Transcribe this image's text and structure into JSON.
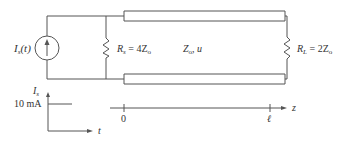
{
  "circuit": {
    "source_label": {
      "main": "I",
      "sub": "s",
      "arg": "(t)"
    },
    "rs_label": {
      "main": "R",
      "sub": "s",
      "eq": " = 4Z",
      "sub2": "o"
    },
    "line_label": {
      "main": "Z",
      "sub": "o",
      "rest": ", u"
    },
    "rl_label": {
      "main": "R",
      "sub": "L",
      "eq": " = 2Z",
      "sub2": "o"
    }
  },
  "source_waveform": {
    "ylabel": {
      "main": "I",
      "sub": "s"
    },
    "level_label": "10 mA",
    "xlabel": "t"
  },
  "z_axis": {
    "label": "z",
    "ticks": [
      "0",
      "ℓ"
    ]
  },
  "colors": {
    "line": "#555555",
    "text": "#333333",
    "background": "#ffffff"
  }
}
